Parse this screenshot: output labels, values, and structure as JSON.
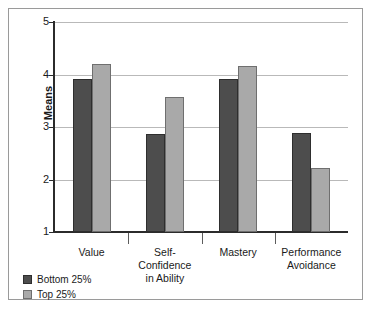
{
  "chart_data": {
    "type": "bar",
    "title": "",
    "subtitle": "",
    "xlabel": "",
    "ylabel": "Means",
    "ylim": [
      1,
      5
    ],
    "yticks": [
      "1",
      "2",
      "3",
      "4",
      "5"
    ],
    "grid": true,
    "legend_position": "bottom-left",
    "categories": [
      "Value",
      "Self-Confidence in Ability",
      "Mastery",
      "Performance Avoidance"
    ],
    "category_lines": [
      [
        "Value"
      ],
      [
        "Self-Confidence",
        "in Ability"
      ],
      [
        "Mastery"
      ],
      [
        "Performance",
        "Avoidance"
      ]
    ],
    "series": [
      {
        "name": "Bottom 25%",
        "color": "#4d4d4d",
        "values": [
          3.92,
          2.86,
          3.92,
          2.88
        ]
      },
      {
        "name": "Top 25%",
        "color": "#a9a9a9",
        "values": [
          4.2,
          3.58,
          4.16,
          2.22
        ]
      }
    ]
  },
  "axis": {
    "y_title": "Means",
    "y_tick_labels": [
      "5",
      "4",
      "3",
      "2",
      "1"
    ]
  },
  "legend": {
    "items": [
      {
        "label": "Bottom 25%",
        "color": "#4d4d4d"
      },
      {
        "label": "Top 25%",
        "color": "#a9a9a9"
      }
    ]
  }
}
